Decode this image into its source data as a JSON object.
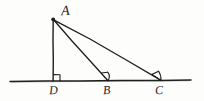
{
  "figure": {
    "kind": "geometry-diagram",
    "background_color": "#fdfdfc",
    "ink_color": "#1c1c1c",
    "canvas": {
      "width": 204,
      "height": 101
    }
  },
  "labels": {
    "apex": "A",
    "foot": "D",
    "mid": "B",
    "right": "C"
  },
  "geometry": {
    "points": {
      "A": {
        "x": 53,
        "y": 19
      },
      "D": {
        "x": 53,
        "y": 81
      },
      "B": {
        "x": 108,
        "y": 81
      },
      "C": {
        "x": 161,
        "y": 81
      }
    },
    "baseline": {
      "x1": 10,
      "y1": 81,
      "x2": 191,
      "y2": 80
    },
    "segments": [
      {
        "name": "AD",
        "from": "A",
        "to": "D"
      },
      {
        "name": "AB",
        "from": "A",
        "to": "B"
      },
      {
        "name": "AC",
        "from": "A",
        "to": "C"
      }
    ],
    "marks": [
      {
        "name": "right-angle-at-D",
        "at": "D",
        "type": "right-angle-square"
      },
      {
        "name": "angle-at-B",
        "at": "B",
        "type": "angle-arc"
      },
      {
        "name": "angle-at-C",
        "at": "C",
        "type": "angle-arc"
      }
    ]
  }
}
